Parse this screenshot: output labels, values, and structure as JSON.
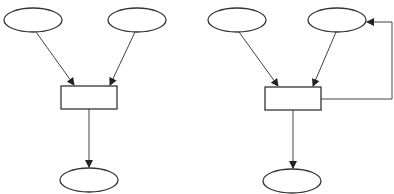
{
  "diagram": {
    "title": "",
    "stroke_color": "#333333",
    "background": "#ffffff",
    "panels": [
      {
        "id": "left",
        "nodes": [
          {
            "id": "input-a",
            "shape": "ellipse",
            "cx": 33,
            "cy": 20,
            "rx": 29,
            "ry": 12,
            "label": ""
          },
          {
            "id": "input-b",
            "shape": "ellipse",
            "cx": 137,
            "cy": 20,
            "rx": 29,
            "ry": 12,
            "label": ""
          },
          {
            "id": "process",
            "shape": "rect",
            "x": 61,
            "y": 86,
            "w": 56,
            "h": 23,
            "label": ""
          },
          {
            "id": "output",
            "shape": "ellipse",
            "cx": 89,
            "cy": 180,
            "rx": 29,
            "ry": 12,
            "label": ""
          }
        ],
        "edges": [
          {
            "from": "input-a",
            "to": "process"
          },
          {
            "from": "input-b",
            "to": "process"
          },
          {
            "from": "process",
            "to": "output"
          }
        ]
      },
      {
        "id": "right",
        "nodes": [
          {
            "id": "input-a",
            "shape": "ellipse",
            "cx": 237,
            "cy": 20,
            "rx": 29,
            "ry": 12,
            "label": ""
          },
          {
            "id": "input-b",
            "shape": "ellipse",
            "cx": 337,
            "cy": 20,
            "rx": 29,
            "ry": 12,
            "label": ""
          },
          {
            "id": "process",
            "shape": "rect",
            "x": 265,
            "y": 87,
            "w": 56,
            "h": 23,
            "label": ""
          },
          {
            "id": "output",
            "shape": "ellipse",
            "cx": 292,
            "cy": 181,
            "rx": 29,
            "ry": 12,
            "label": ""
          }
        ],
        "edges": [
          {
            "from": "input-a",
            "to": "process"
          },
          {
            "from": "input-b",
            "to": "process"
          },
          {
            "from": "process",
            "to": "output"
          },
          {
            "from": "process",
            "to": "input-b",
            "type": "feedback"
          }
        ]
      }
    ]
  }
}
